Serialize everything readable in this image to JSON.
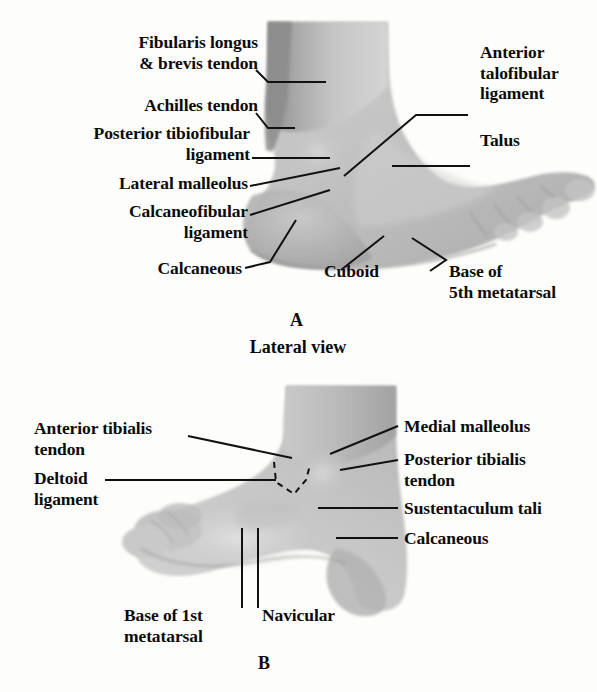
{
  "figure": {
    "background_color": "#fdfdfc",
    "ink_color": "#0b0b0b",
    "skin_light": "#d9d9d9",
    "skin_mid": "#c0c0c0",
    "skin_dark": "#8f8f8f"
  },
  "panel_a": {
    "caption_letter": "A",
    "caption_text": "Lateral view",
    "view": "Lateral view",
    "labels": [
      {
        "id": "fibularis",
        "text": "Fibularis longus\n& brevis tendon",
        "side": "left"
      },
      {
        "id": "achilles",
        "text": "Achilles tendon",
        "side": "left"
      },
      {
        "id": "posterior-tibiofibular",
        "text": "Posterior tibiofibular\nligament",
        "side": "left"
      },
      {
        "id": "lateral-malleolus",
        "text": "Lateral malleolus",
        "side": "left"
      },
      {
        "id": "calcaneofibular",
        "text": "Calcaneofibular\nligament",
        "side": "left"
      },
      {
        "id": "calcaneous",
        "text": "Calcaneous",
        "side": "left"
      },
      {
        "id": "anterior-talofibular",
        "text": "Anterior\ntalofibular\nligament",
        "side": "right"
      },
      {
        "id": "talus",
        "text": "Talus",
        "side": "right"
      },
      {
        "id": "cuboid",
        "text": "Cuboid",
        "side": "bottom"
      },
      {
        "id": "base-5th-metatarsal",
        "text": "Base of\n5th metatarsal",
        "side": "bottom"
      }
    ]
  },
  "panel_b": {
    "caption_letter": "B",
    "labels": [
      {
        "id": "anterior-tibialis",
        "text": "Anterior tibialis\ntendon",
        "side": "left"
      },
      {
        "id": "deltoid",
        "text": "Deltoid\nligament",
        "side": "left"
      },
      {
        "id": "medial-malleolus",
        "text": "Medial malleolus",
        "side": "right"
      },
      {
        "id": "posterior-tibialis",
        "text": "Posterior tibialis\ntendon",
        "side": "right"
      },
      {
        "id": "sustentaculum-tali",
        "text": "Sustentaculum tali",
        "side": "right"
      },
      {
        "id": "calcaneous",
        "text": "Calcaneous",
        "side": "right"
      },
      {
        "id": "base-1st-metatarsal",
        "text": "Base of 1st\nmetatarsal",
        "side": "bottom"
      },
      {
        "id": "navicular",
        "text": "Navicular",
        "side": "bottom"
      }
    ]
  }
}
